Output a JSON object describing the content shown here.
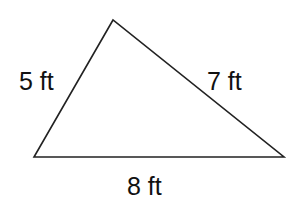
{
  "diagram": {
    "type": "triangle",
    "stroke_color": "#222222",
    "vertices": {
      "top": [
        113,
        20
      ],
      "bottom_left": [
        34,
        157
      ],
      "bottom_right": [
        284,
        157
      ]
    },
    "sides": [
      {
        "name": "left",
        "length": 5,
        "unit": "ft",
        "label": "5 ft",
        "label_pos": [
          19,
          90
        ]
      },
      {
        "name": "right",
        "length": 7,
        "unit": "ft",
        "label": "7 ft",
        "label_pos": [
          207,
          90
        ]
      },
      {
        "name": "bottom",
        "length": 8,
        "unit": "ft",
        "label": "8 ft",
        "label_pos": [
          127,
          195
        ]
      }
    ]
  }
}
